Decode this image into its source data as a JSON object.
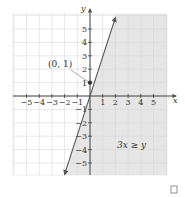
{
  "chart_data": {
    "type": "line",
    "title": "",
    "xlabel": "x",
    "ylabel": "y",
    "xlim": [
      -6.2,
      6.2
    ],
    "ylim": [
      -6.2,
      6.2
    ],
    "grid": true,
    "x_ticks": [
      -5,
      -4,
      -3,
      -2,
      -1,
      1,
      2,
      3,
      4,
      5
    ],
    "y_ticks": [
      -5,
      -4,
      -3,
      -2,
      -1,
      1,
      2,
      3,
      4,
      5
    ],
    "x_tick_labels": [
      "−5",
      "−4",
      "−3",
      "−2",
      "−1",
      "1",
      "2",
      "3",
      "4",
      "5"
    ],
    "y_tick_labels": [
      "−5",
      "−4",
      "−3",
      "−2",
      "−1",
      "1",
      "2",
      "3",
      "4",
      "5"
    ],
    "series": [
      {
        "name": "boundary line y = 3x",
        "x": [
          -2,
          2
        ],
        "y": [
          -6,
          6
        ],
        "style": "solid",
        "arrows": "both"
      }
    ],
    "shaded_region": {
      "inequality": "3x ≥ y",
      "side": "right-of-line"
    },
    "points": [
      {
        "x": 0,
        "y": 1,
        "label": "(0, 1)"
      }
    ],
    "annotations": [
      {
        "text": "(0, 1)",
        "points_to": [
          0,
          1
        ]
      },
      {
        "text": "3x ≥ y",
        "region": "lower-right"
      }
    ],
    "colors": {
      "line": "#555555",
      "shade": "#e6e6e6",
      "grid": "#d6d6d6",
      "axis": "#333333"
    }
  },
  "footer": {
    "checkbox_icon": "empty-square-icon"
  }
}
